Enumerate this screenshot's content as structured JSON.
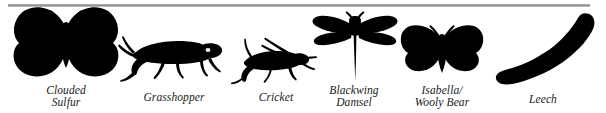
{
  "plate": {
    "background_color": "#ffffff",
    "silhouette_color": "#000000",
    "rule_color": "#8e8e8e",
    "figures": [
      {
        "id": "clouded-sulfur",
        "icon": "butterfly-silhouette",
        "caption": "Clouded\nSulfur",
        "caption_line_1": "Clouded",
        "caption_line_2": "Sulfur"
      },
      {
        "id": "grasshopper",
        "icon": "grasshopper-silhouette",
        "caption": "Grasshopper",
        "caption_line_1": "Grasshopper",
        "caption_line_2": ""
      },
      {
        "id": "cricket",
        "icon": "cricket-silhouette",
        "caption": "Cricket",
        "caption_line_1": "Cricket",
        "caption_line_2": ""
      },
      {
        "id": "blackwing-damsel",
        "icon": "damselfly-silhouette",
        "caption": "Blackwing\nDamsel",
        "caption_line_1": "Blackwing",
        "caption_line_2": "Damsel"
      },
      {
        "id": "isabella-wooly-bear",
        "icon": "moth-silhouette",
        "caption": "Isabella/\nWooly Bear",
        "caption_line_1": "Isabella/",
        "caption_line_2": "Wooly Bear"
      },
      {
        "id": "leech",
        "icon": "leech-silhouette",
        "caption": "Leech",
        "caption_line_1": "Leech",
        "caption_line_2": ""
      }
    ]
  }
}
